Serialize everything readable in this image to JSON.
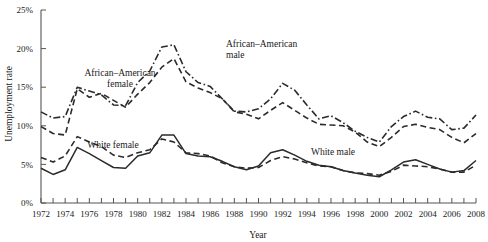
{
  "chart_data": {
    "type": "line",
    "title": "",
    "xlabel": "Year",
    "ylabel": "Unemployment rate",
    "xlim": [
      1972,
      2008
    ],
    "ylim": [
      0,
      25
    ],
    "grid": false,
    "legend_position": "inline-annotations",
    "y_tick_labels": [
      "0%",
      "5%",
      "10%",
      "15%",
      "20%",
      "25%"
    ],
    "y_tick_values": [
      0,
      5,
      10,
      15,
      20,
      25
    ],
    "x_tick_labels": [
      "1972",
      "1974",
      "1976",
      "1978",
      "1980",
      "1982",
      "1984",
      "1986",
      "1988",
      "1990",
      "1992",
      "1994",
      "1996",
      "1998",
      "2000",
      "2002",
      "2004",
      "2006",
      "2008"
    ],
    "x_tick_values": [
      1972,
      1974,
      1976,
      1978,
      1980,
      1982,
      1984,
      1986,
      1988,
      1990,
      1992,
      1994,
      1996,
      1998,
      2000,
      2002,
      2004,
      2006,
      2008
    ],
    "x_minor_tick_values": [
      1972,
      1973,
      1974,
      1975,
      1976,
      1977,
      1978,
      1979,
      1980,
      1981,
      1982,
      1983,
      1984,
      1985,
      1986,
      1987,
      1988,
      1989,
      1990,
      1991,
      1992,
      1993,
      1994,
      1995,
      1996,
      1997,
      1998,
      1999,
      2000,
      2001,
      2002,
      2003,
      2004,
      2005,
      2006,
      2007,
      2008
    ],
    "x": [
      1972,
      1973,
      1974,
      1975,
      1976,
      1977,
      1978,
      1979,
      1980,
      1981,
      1982,
      1983,
      1984,
      1985,
      1986,
      1987,
      1988,
      1989,
      1990,
      1991,
      1992,
      1993,
      1994,
      1995,
      1996,
      1997,
      1998,
      1999,
      2000,
      2001,
      2002,
      2003,
      2004,
      2005,
      2006,
      2007,
      2008
    ],
    "series": [
      {
        "name": "African-American male",
        "label": "African–American male",
        "style": "dash-dot",
        "color": "#2b2b2b",
        "values": [
          11.8,
          11.0,
          11.2,
          15.0,
          14.5,
          14.0,
          12.7,
          12.6,
          15.6,
          17.1,
          20.2,
          20.5,
          17.0,
          15.6,
          15.1,
          13.5,
          11.9,
          11.8,
          12.2,
          13.5,
          15.5,
          14.6,
          12.7,
          10.9,
          11.3,
          10.4,
          9.3,
          8.5,
          7.9,
          9.9,
          11.2,
          11.9,
          11.1,
          10.9,
          9.5,
          9.7,
          11.4
        ]
      },
      {
        "name": "African-American female",
        "label": "African–American female",
        "style": "dashed",
        "color": "#2b2b2b",
        "values": [
          9.9,
          9.0,
          8.8,
          14.8,
          13.7,
          14.2,
          13.3,
          12.4,
          14.1,
          15.6,
          17.6,
          18.7,
          15.7,
          14.9,
          14.3,
          13.5,
          11.8,
          11.5,
          10.9,
          12.0,
          13.0,
          12.0,
          11.0,
          10.2,
          10.1,
          10.0,
          9.2,
          7.9,
          7.3,
          8.5,
          9.9,
          10.2,
          9.8,
          9.5,
          8.5,
          7.8,
          9.0
        ]
      },
      {
        "name": "White female",
        "label": "White female",
        "style": "dashed",
        "color": "#2b2b2b",
        "values": [
          5.9,
          5.3,
          6.1,
          8.6,
          7.9,
          7.3,
          6.2,
          5.9,
          6.5,
          6.9,
          8.3,
          7.9,
          6.5,
          6.4,
          6.1,
          5.2,
          4.7,
          4.5,
          4.6,
          5.5,
          6.0,
          5.7,
          5.2,
          4.8,
          4.7,
          4.2,
          3.9,
          3.8,
          3.6,
          4.1,
          4.9,
          4.8,
          4.7,
          4.4,
          4.0,
          4.0,
          4.9
        ]
      },
      {
        "name": "White male",
        "label": "White male",
        "style": "solid",
        "color": "#2b2b2b",
        "values": [
          4.5,
          3.7,
          4.3,
          7.2,
          6.4,
          5.5,
          4.6,
          4.5,
          6.1,
          6.5,
          8.8,
          8.8,
          6.4,
          6.1,
          6.0,
          5.4,
          4.7,
          4.3,
          4.8,
          6.5,
          6.9,
          6.2,
          5.4,
          4.9,
          4.7,
          4.2,
          3.9,
          3.6,
          3.4,
          4.3,
          5.3,
          5.6,
          5.0,
          4.4,
          4.0,
          4.2,
          5.5
        ]
      }
    ],
    "annotations": [
      {
        "text": "African–American male",
        "series": "African-American male",
        "line1": "African–American",
        "line2": "male"
      },
      {
        "text": "African–American female",
        "series": "African-American female",
        "line1": "African–American",
        "line2": "female"
      },
      {
        "text": "White female",
        "series": "White female",
        "line1": "White female",
        "line2": ""
      },
      {
        "text": "White male",
        "series": "White male",
        "line1": "White male",
        "line2": ""
      }
    ]
  }
}
